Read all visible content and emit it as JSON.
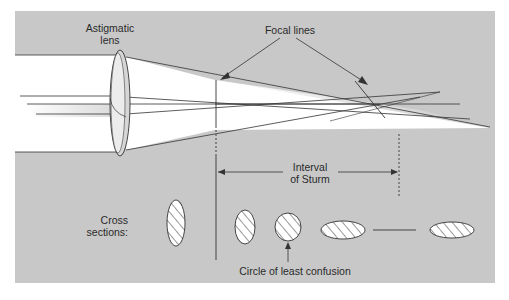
{
  "diagram": {
    "labels": {
      "lens_line1": "Astigmatic",
      "lens_line2": "lens",
      "focal_lines": "Focal lines",
      "interval_line1": "Interval",
      "interval_line2": "of Sturm",
      "cross_line1": "Cross",
      "cross_line2": "sections:",
      "circle_least_confusion": "Circle of least confusion"
    },
    "cross_sections": [
      {
        "shape": "vertical-ellipse",
        "position": "before lens focus"
      },
      {
        "shape": "vertical-ellipse",
        "position": "first focal line"
      },
      {
        "shape": "circle",
        "position": "circle of least confusion"
      },
      {
        "shape": "horizontal-ellipse",
        "position": "approaching second focal line"
      },
      {
        "shape": "horizontal-line",
        "position": "second focal line"
      },
      {
        "shape": "horizontal-ellipse",
        "position": "beyond second focal line"
      }
    ],
    "colors": {
      "panel": "#c8c8c8",
      "beam": "#ffffff",
      "line": "#333333",
      "lens": "#bdbdbd"
    }
  }
}
